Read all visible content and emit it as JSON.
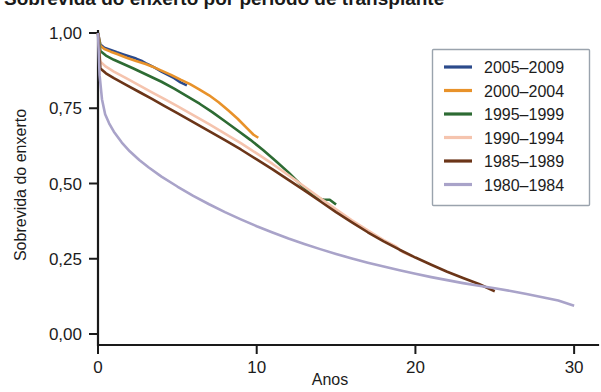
{
  "title_fragment": "Sobrevida do enxerto por período de transplante",
  "chart_data": {
    "type": "line",
    "title": "",
    "xlabel": "Anos",
    "ylabel": "Sobrevida do enxerto",
    "xlim": [
      0,
      31
    ],
    "ylim": [
      0,
      1
    ],
    "xticks": [
      0,
      10,
      20,
      30
    ],
    "xtick_labels": [
      "0",
      "10",
      "20",
      "30"
    ],
    "yticks": [
      0,
      0.25,
      0.5,
      0.75,
      1
    ],
    "ytick_labels": [
      "0,00",
      "0,25",
      "0,50",
      "0,75",
      "1,00"
    ],
    "grid": false,
    "legend_position": "upper-right",
    "decimal_separator": ",",
    "series": [
      {
        "name": "2005–2009",
        "color": "#2b4a8b",
        "x": [
          0,
          0.15,
          0.4,
          0.8,
          1.2,
          1.6,
          2.0,
          2.4,
          2.8,
          3.0,
          3.2,
          3.6,
          4.0,
          4.4,
          4.8,
          5.2,
          5.6
        ],
        "y": [
          1.0,
          0.962,
          0.951,
          0.944,
          0.936,
          0.929,
          0.922,
          0.915,
          0.906,
          0.9,
          0.895,
          0.884,
          0.872,
          0.861,
          0.85,
          0.836,
          0.826
        ]
      },
      {
        "name": "2000–2004",
        "color": "#e8922a",
        "x": [
          0,
          0.15,
          0.4,
          0.8,
          1.2,
          1.8,
          2.4,
          3.0,
          3.4,
          4.0,
          4.6,
          5.2,
          5.8,
          6.4,
          7.0,
          7.6,
          8.2,
          8.8,
          9.4,
          9.8,
          10.1
        ],
        "y": [
          1.0,
          0.958,
          0.947,
          0.938,
          0.93,
          0.918,
          0.907,
          0.897,
          0.889,
          0.875,
          0.861,
          0.845,
          0.83,
          0.812,
          0.793,
          0.77,
          0.743,
          0.715,
          0.683,
          0.662,
          0.652
        ]
      },
      {
        "name": "1995–1999",
        "color": "#2d6b33",
        "x": [
          0,
          0.15,
          0.5,
          1.0,
          1.6,
          2.2,
          2.8,
          3.4,
          4.0,
          4.8,
          5.6,
          6.4,
          7.2,
          8.0,
          8.8,
          9.6,
          10.4,
          11.2,
          12.0,
          12.8,
          13.4,
          13.9,
          14.2,
          14.6,
          15.0
        ],
        "y": [
          1.0,
          0.94,
          0.925,
          0.911,
          0.897,
          0.883,
          0.868,
          0.853,
          0.838,
          0.815,
          0.79,
          0.765,
          0.737,
          0.707,
          0.676,
          0.645,
          0.611,
          0.575,
          0.537,
          0.495,
          0.468,
          0.45,
          0.447,
          0.446,
          0.43
        ]
      },
      {
        "name": "1990–1994",
        "color": "#f5c4ae",
        "x": [
          0,
          0.15,
          0.5,
          1.0,
          1.8,
          2.6,
          3.4,
          4.2,
          5.0,
          6.0,
          7.0,
          8.0,
          9.0,
          10.0,
          11.0,
          12.0,
          13.0,
          14.0,
          15.0,
          16.0,
          17.0,
          18.0,
          18.8,
          19.2,
          19.8
        ],
        "y": [
          1.0,
          0.905,
          0.888,
          0.872,
          0.849,
          0.826,
          0.803,
          0.78,
          0.757,
          0.727,
          0.697,
          0.666,
          0.634,
          0.6,
          0.565,
          0.528,
          0.49,
          0.452,
          0.414,
          0.378,
          0.344,
          0.312,
          0.29,
          0.272,
          0.258
        ]
      },
      {
        "name": "1985–1989",
        "color": "#6b3518",
        "x": [
          0,
          0.15,
          0.5,
          1.0,
          1.8,
          2.6,
          3.4,
          4.2,
          5.0,
          6.0,
          7.0,
          8.0,
          9.0,
          10.0,
          11.0,
          12.0,
          13.0,
          14.0,
          15.0,
          16.0,
          17.0,
          18.0,
          19.0,
          20.0,
          21.0,
          22.0,
          23.0,
          24.0,
          25.0
        ],
        "y": [
          1.0,
          0.882,
          0.866,
          0.85,
          0.827,
          0.804,
          0.781,
          0.757,
          0.734,
          0.704,
          0.674,
          0.644,
          0.613,
          0.58,
          0.547,
          0.512,
          0.477,
          0.441,
          0.405,
          0.371,
          0.338,
          0.308,
          0.28,
          0.254,
          0.23,
          0.207,
          0.186,
          0.166,
          0.142
        ]
      },
      {
        "name": "1980–1984",
        "color": "#a9a3c9",
        "x": [
          0,
          0.1,
          0.25,
          0.45,
          0.7,
          1.0,
          1.5,
          2.0,
          2.6,
          3.2,
          4.0,
          5.0,
          6.0,
          7.0,
          8.0,
          9.0,
          10.0,
          11.0,
          12.0,
          13.0,
          14.0,
          15.0,
          16.0,
          17.0,
          18.0,
          19.0,
          20.0,
          21.0,
          22.0,
          23.0,
          24.0,
          25.0,
          26.0,
          27.0,
          28.0,
          29.0,
          30.0
        ],
        "y": [
          1.0,
          0.86,
          0.78,
          0.73,
          0.7,
          0.672,
          0.636,
          0.607,
          0.578,
          0.553,
          0.523,
          0.49,
          0.459,
          0.431,
          0.405,
          0.381,
          0.358,
          0.337,
          0.317,
          0.299,
          0.282,
          0.266,
          0.251,
          0.237,
          0.224,
          0.212,
          0.2,
          0.189,
          0.179,
          0.169,
          0.16,
          0.152,
          0.143,
          0.133,
          0.122,
          0.111,
          0.094
        ]
      }
    ]
  },
  "legend": {
    "items": [
      {
        "label": "2005–2009",
        "color": "#2b4a8b"
      },
      {
        "label": "2000–2004",
        "color": "#e8922a"
      },
      {
        "label": "1995–1999",
        "color": "#2d6b33"
      },
      {
        "label": "1990–1994",
        "color": "#f5c4ae"
      },
      {
        "label": "1985–1989",
        "color": "#6b3518"
      },
      {
        "label": "1980–1984",
        "color": "#a9a3c9"
      }
    ]
  }
}
